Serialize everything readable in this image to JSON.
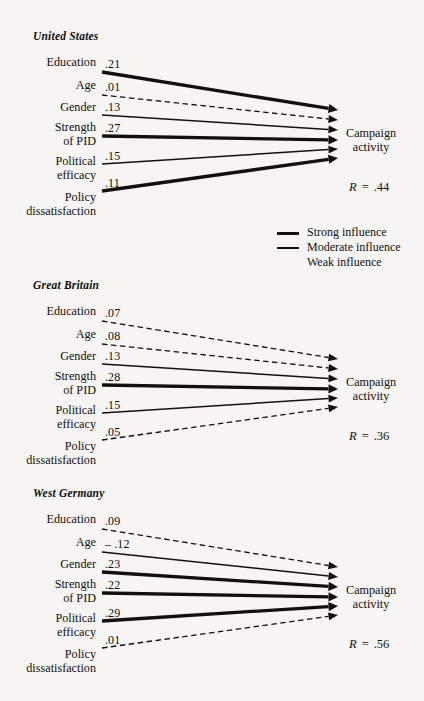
{
  "figure": {
    "target_label_line1": "Campaign",
    "target_label_line2": "activity",
    "r_symbol": "R",
    "r_equals": "=",
    "predictor_labels": [
      {
        "line1": "Education",
        "line2": ""
      },
      {
        "line1": "Age",
        "line2": ""
      },
      {
        "line1": "Gender",
        "line2": ""
      },
      {
        "line1": "Strength",
        "line2": "of PID"
      },
      {
        "line1": "Political",
        "line2": "efficacy"
      },
      {
        "line1": "Policy",
        "line2": "dissatisfaction"
      }
    ]
  },
  "legend": {
    "items": [
      {
        "label": "Strong influence",
        "style": "strong"
      },
      {
        "label": "Moderate influence",
        "style": "moderate"
      },
      {
        "label": "Weak influence",
        "style": "weak"
      }
    ]
  },
  "chart_data": {
    "type": "diagram",
    "title": "",
    "diagram_kind": "path-model",
    "outcome": "Campaign activity",
    "predictors": [
      "Education",
      "Age",
      "Gender",
      "Strength of PID",
      "Political efficacy",
      "Policy dissatisfaction"
    ],
    "influence_levels": [
      "Strong influence",
      "Moderate influence",
      "Weak influence"
    ],
    "panels": [
      {
        "name": "United States",
        "R": ".44",
        "paths": [
          {
            "predictor": "Education",
            "value": ".21",
            "influence": "strong"
          },
          {
            "predictor": "Age",
            "value": ".01",
            "influence": "weak"
          },
          {
            "predictor": "Gender",
            "value": ".13",
            "influence": "moderate"
          },
          {
            "predictor": "Strength of PID",
            "value": ".27",
            "influence": "strong"
          },
          {
            "predictor": "Political efficacy",
            "value": ".15",
            "influence": "moderate"
          },
          {
            "predictor": "Policy dissatisfaction",
            "value": ".11",
            "influence": "strong"
          }
        ]
      },
      {
        "name": "Great Britain",
        "R": ".36",
        "paths": [
          {
            "predictor": "Education",
            "value": ".07",
            "influence": "weak"
          },
          {
            "predictor": "Age",
            "value": ".08",
            "influence": "weak"
          },
          {
            "predictor": "Gender",
            "value": ".13",
            "influence": "moderate"
          },
          {
            "predictor": "Strength of PID",
            "value": ".28",
            "influence": "strong"
          },
          {
            "predictor": "Political efficacy",
            "value": ".15",
            "influence": "moderate"
          },
          {
            "predictor": "Policy dissatisfaction",
            "value": ".05",
            "influence": "weak"
          }
        ]
      },
      {
        "name": "West Germany",
        "R": ".56",
        "paths": [
          {
            "predictor": "Education",
            "value": ".09",
            "influence": "weak"
          },
          {
            "predictor": "Age",
            "value": "– .12",
            "influence": "moderate"
          },
          {
            "predictor": "Gender",
            "value": ".23",
            "influence": "strong"
          },
          {
            "predictor": "Strength of PID",
            "value": ".22",
            "influence": "strong"
          },
          {
            "predictor": "Political efficacy",
            "value": ".29",
            "influence": "strong"
          },
          {
            "predictor": "Policy dissatisfaction",
            "value": ".01",
            "influence": "weak"
          }
        ]
      }
    ]
  }
}
